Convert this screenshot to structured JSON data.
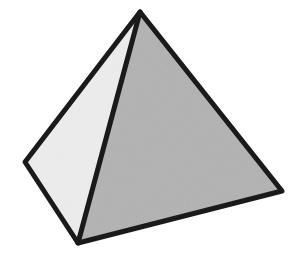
{
  "canvas": {
    "width": 301,
    "height": 253,
    "background_color": "#ffffff"
  },
  "figure": {
    "name": "pyramid",
    "outline_color": "#1a1a1a",
    "outline_width": 5,
    "vertices": {
      "apex": {
        "x": 140,
        "y": 12
      },
      "left": {
        "x": 25,
        "y": 162
      },
      "front": {
        "x": 78,
        "y": 243
      },
      "right": {
        "x": 282,
        "y": 191
      }
    },
    "faces": [
      {
        "name": "left-face",
        "fill_color": "#ededed",
        "points": "140,12 25,162 78,243"
      },
      {
        "name": "right-face",
        "fill_color": "#b2b2b2",
        "points": "140,12 78,243 282,191"
      }
    ],
    "edges": [
      {
        "name": "apex-to-left-edge",
        "x1": 140,
        "y1": 12,
        "x2": 25,
        "y2": 162
      },
      {
        "name": "apex-to-front-edge",
        "x1": 140,
        "y1": 12,
        "x2": 78,
        "y2": 243
      },
      {
        "name": "apex-to-right-edge",
        "x1": 140,
        "y1": 12,
        "x2": 282,
        "y2": 191
      },
      {
        "name": "left-to-front-edge",
        "x1": 25,
        "y1": 162,
        "x2": 78,
        "y2": 243
      },
      {
        "name": "front-to-right-edge",
        "x1": 78,
        "y1": 243,
        "x2": 282,
        "y2": 191
      }
    ]
  }
}
